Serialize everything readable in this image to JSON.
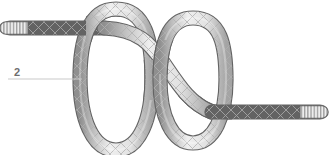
{
  "figure": {
    "kind": "knot-diagram",
    "background_color": "#ffffff",
    "step_number": "2",
    "callout": {
      "label": "2",
      "label_color": "#6e6e6e",
      "label_x": 14,
      "label_y": 72,
      "leader_line": {
        "x1": 8,
        "y1": 79,
        "x2": 82,
        "y2": 79,
        "color": "#c9c9c9",
        "width": 1
      }
    },
    "rope": {
      "body_color": "#e9e9e9",
      "shade_color": "#a6a6a6",
      "highlight_color": "#f7f7f7",
      "outline_color": "#636363",
      "weave_color": "#b4b4b4",
      "thickness": 13,
      "outline_width": 1.1
    },
    "ends": [
      {
        "name": "standing-end",
        "side": "left",
        "tip_x": 6,
        "tip_y": 28,
        "whipping": "striped",
        "stripe_count": 6
      },
      {
        "name": "working-end",
        "side": "right",
        "tip_x": 322,
        "tip_y": 113,
        "whipping": "striped",
        "stripe_count": 6
      }
    ],
    "loops": [
      {
        "name": "left-loop",
        "cx": 116,
        "cy": 78,
        "rx": 36,
        "ry": 72
      },
      {
        "name": "right-loop",
        "cx": 193,
        "cy": 80,
        "rx": 33,
        "ry": 62
      }
    ],
    "crossings": [
      {
        "name": "crossing-top-left",
        "x": 96,
        "y": 31
      },
      {
        "name": "crossing-center",
        "x": 152,
        "y": 78
      },
      {
        "name": "crossing-mid-right",
        "x": 176,
        "y": 62
      },
      {
        "name": "crossing-bottom",
        "x": 214,
        "y": 112
      }
    ]
  }
}
